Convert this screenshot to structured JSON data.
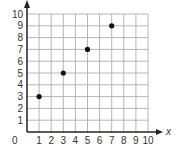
{
  "chart_data": {
    "type": "scatter",
    "title": "",
    "xlabel": "x",
    "ylabel": "",
    "xlim": [
      0,
      10
    ],
    "ylim": [
      0,
      10
    ],
    "grid": true,
    "legend": null,
    "x_ticks": [
      "0",
      "1",
      "2",
      "3",
      "4",
      "5",
      "6",
      "7",
      "8",
      "9",
      "10"
    ],
    "y_ticks": [
      "1",
      "2",
      "3",
      "4",
      "5",
      "6",
      "7",
      "8",
      "9",
      "10"
    ],
    "origin_label": "0",
    "series": [
      {
        "name": "points",
        "points": [
          {
            "x": 1,
            "y": 3
          },
          {
            "x": 3,
            "y": 5
          },
          {
            "x": 5,
            "y": 7
          },
          {
            "x": 7,
            "y": 9
          }
        ]
      }
    ]
  },
  "colors": {
    "grid": "#b5b5b5",
    "axis": "#222222",
    "point": "#111111",
    "text": "#333333"
  }
}
